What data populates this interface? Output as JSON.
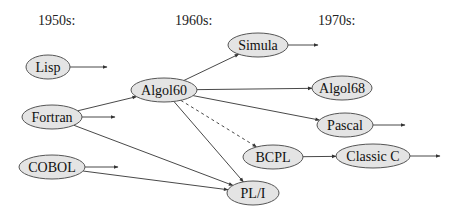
{
  "eras": [
    {
      "id": "1950s",
      "label": "1950s:",
      "x": 38,
      "y": 25
    },
    {
      "id": "1960s",
      "label": "1960s:",
      "x": 175,
      "y": 25
    },
    {
      "id": "1970s",
      "label": "1970s:",
      "x": 318,
      "y": 25
    }
  ],
  "nodes": {
    "lisp": {
      "label": "Lisp",
      "cx": 48,
      "cy": 67,
      "rx": 22,
      "ry": 12
    },
    "fortran": {
      "label": "Fortran",
      "cx": 52,
      "cy": 117,
      "rx": 30,
      "ry": 12
    },
    "cobol": {
      "label": "COBOL",
      "cx": 52,
      "cy": 167,
      "rx": 33,
      "ry": 12
    },
    "algol60": {
      "label": "Algol60",
      "cx": 164,
      "cy": 90,
      "rx": 33,
      "ry": 12
    },
    "simula": {
      "label": "Simula",
      "cx": 258,
      "cy": 45,
      "rx": 30,
      "ry": 12
    },
    "algol68": {
      "label": "Algol68",
      "cx": 342,
      "cy": 88,
      "rx": 30,
      "ry": 12
    },
    "pascal": {
      "label": "Pascal",
      "cx": 345,
      "cy": 125,
      "rx": 28,
      "ry": 12
    },
    "bcpl": {
      "label": "BCPL",
      "cx": 273,
      "cy": 157,
      "rx": 30,
      "ry": 12
    },
    "classic_c": {
      "label": "Classic C",
      "cx": 373,
      "cy": 156,
      "rx": 37,
      "ry": 12
    },
    "pl1": {
      "label": "PL/I",
      "cx": 253,
      "cy": 193,
      "rx": 26,
      "ry": 12
    }
  },
  "edges": [
    {
      "from": "fortran",
      "to": "algol60",
      "style": "solid"
    },
    {
      "from": "fortran",
      "to": "pl1",
      "style": "solid"
    },
    {
      "from": "cobol",
      "to": "pl1",
      "style": "solid"
    },
    {
      "from": "algol60",
      "to": "simula",
      "style": "solid"
    },
    {
      "from": "algol60",
      "to": "algol68",
      "style": "solid"
    },
    {
      "from": "algol60",
      "to": "pascal",
      "style": "solid"
    },
    {
      "from": "algol60",
      "to": "bcpl",
      "style": "dashed"
    },
    {
      "from": "algol60",
      "to": "pl1",
      "style": "solid"
    },
    {
      "from": "bcpl",
      "to": "classic_c",
      "style": "solid"
    }
  ],
  "stub_arrows": [
    {
      "from": "lisp",
      "x2": 107,
      "y2": 67
    },
    {
      "from": "fortran",
      "x2": 115,
      "y2": 117
    },
    {
      "from": "cobol",
      "x2": 118,
      "y2": 167
    },
    {
      "from": "simula",
      "x2": 318,
      "y2": 45
    },
    {
      "from": "pascal",
      "x2": 405,
      "y2": 125
    },
    {
      "from": "classic_c",
      "x2": 440,
      "y2": 156
    }
  ]
}
